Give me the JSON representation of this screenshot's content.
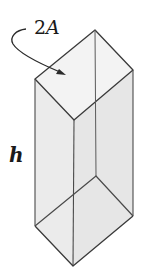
{
  "figure": {
    "type": "prism-diagram",
    "colors": {
      "stroke": "#3a3a3a",
      "face_fill": "#ececec",
      "top_fill": "#f4f4f4",
      "background": "#ffffff"
    }
  },
  "labels": {
    "area_coefficient": "2",
    "area_variable": "A",
    "height": "h"
  },
  "geometry": {
    "top_face": [
      [
        95,
        30
      ],
      [
        133,
        70
      ],
      [
        74,
        120
      ],
      [
        35,
        79
      ]
    ],
    "bottom_face": [
      [
        96,
        176
      ],
      [
        133,
        216
      ],
      [
        73,
        266
      ],
      [
        35,
        226
      ]
    ]
  }
}
